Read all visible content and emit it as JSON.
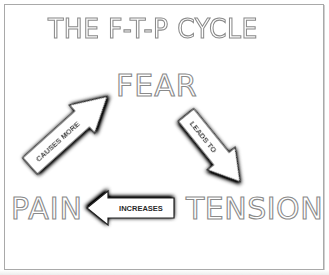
{
  "diagram": {
    "title": "THE F-T-P CYCLE",
    "type": "cycle",
    "nodes": [
      {
        "id": "fear",
        "label": "FEAR"
      },
      {
        "id": "tension",
        "label": "TENSION"
      },
      {
        "id": "pain",
        "label": "PAIN"
      }
    ],
    "edges": [
      {
        "from": "fear",
        "to": "tension",
        "label": "LEADS TO"
      },
      {
        "from": "tension",
        "to": "pain",
        "label": "INCREASES"
      },
      {
        "from": "pain",
        "to": "fear",
        "label": "CAUSES MORE"
      }
    ],
    "colors": {
      "text_outline": "#8a8a8a",
      "text_fill": "#ffffff",
      "arrow_fill": "#ffffff",
      "arrow_shadow": "#1a1a1a",
      "label_text": "#2a2a2a",
      "frame_border": "#a9a9a9"
    }
  }
}
